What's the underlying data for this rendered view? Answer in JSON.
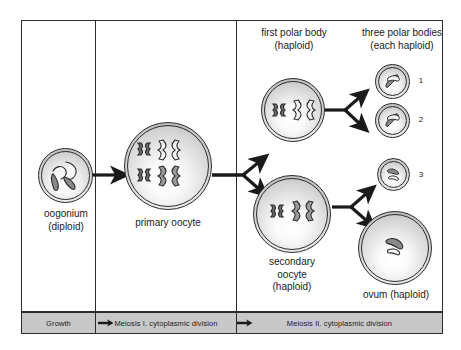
{
  "diagram": {
    "background_color": "#ffffff",
    "line_color": "#2b2b2b",
    "phase_bar_color": "#c8c8c8"
  },
  "phases": [
    {
      "id": "growth",
      "label": "Growth"
    },
    {
      "id": "meiosis-1",
      "label": "Meiosis I. cytoplasmic division"
    },
    {
      "id": "meiosis-2",
      "label": "Meiosis II. cytoplasmic division"
    }
  ],
  "cells": {
    "oogonium": {
      "label_line1": "oogonium",
      "label_line2": "(diploid)",
      "chromosome_count": 4,
      "chromosome_shape": "rod"
    },
    "primary_oocyte": {
      "label_line1": "primary oocyte",
      "label_line2": "",
      "chromosome_count": 4,
      "chromosome_shape": "tetrad"
    },
    "first_polar_body": {
      "label_line1": "first polar body",
      "label_line2": "(haploid)",
      "chromosome_count": 2,
      "chromosome_shape": "tetrad"
    },
    "secondary_oocyte": {
      "label_line1": "secondary",
      "label_line2": "oocyte",
      "label_line3": "(haploid)",
      "chromosome_count": 2,
      "chromosome_shape": "tetrad"
    },
    "three_polar_bodies": {
      "label_line1": "three polar bodies",
      "label_line2": "(each haploid)",
      "items": [
        {
          "number": "1",
          "chromosome_count": 2
        },
        {
          "number": "2",
          "chromosome_count": 2
        },
        {
          "number": "3",
          "chromosome_count": 2
        }
      ]
    },
    "ovum": {
      "label_line1": "ovum (haploid)",
      "chromosome_count": 2,
      "chromosome_shape": "rod"
    }
  }
}
